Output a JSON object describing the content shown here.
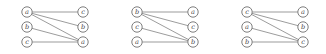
{
  "figure": {
    "type": "bipartite-graph-triptych",
    "background_color": "#ffffff",
    "node_stroke_color": "#6f6f6f",
    "edge_stroke_color": "#8a8a8a",
    "label_color": "#4a4a4a"
  },
  "graphs": [
    {
      "id": "graph-1",
      "left_nodes": [
        {
          "id": "L0",
          "label": "a",
          "cx": 27,
          "cy": 12
        },
        {
          "id": "L1",
          "label": "b",
          "cx": 27,
          "cy": 27
        },
        {
          "id": "L2",
          "label": "c",
          "cx": 27,
          "cy": 42
        }
      ],
      "right_nodes": [
        {
          "id": "R0",
          "label": "c",
          "cx": 83,
          "cy": 12
        },
        {
          "id": "R1",
          "label": "b",
          "cx": 83,
          "cy": 27
        },
        {
          "id": "R2",
          "label": "a",
          "cx": 83,
          "cy": 42
        }
      ],
      "edges": [
        {
          "from": "L0",
          "to": "R0"
        },
        {
          "from": "L0",
          "to": "R1"
        },
        {
          "from": "L0",
          "to": "R2"
        },
        {
          "from": "L1",
          "to": "R2"
        },
        {
          "from": "L2",
          "to": "R2"
        }
      ]
    },
    {
      "id": "graph-2",
      "left_nodes": [
        {
          "id": "L0",
          "label": "b",
          "cx": 27,
          "cy": 12
        },
        {
          "id": "L1",
          "label": "c",
          "cx": 27,
          "cy": 27
        },
        {
          "id": "L2",
          "label": "a",
          "cx": 27,
          "cy": 42
        }
      ],
      "right_nodes": [
        {
          "id": "R0",
          "label": "a",
          "cx": 83,
          "cy": 12
        },
        {
          "id": "R1",
          "label": "c",
          "cx": 83,
          "cy": 27
        },
        {
          "id": "R2",
          "label": "b",
          "cx": 83,
          "cy": 42
        }
      ],
      "edges": [
        {
          "from": "L0",
          "to": "R0"
        },
        {
          "from": "L0",
          "to": "R1"
        },
        {
          "from": "L0",
          "to": "R2"
        },
        {
          "from": "L1",
          "to": "R2"
        },
        {
          "from": "L2",
          "to": "R2"
        }
      ]
    },
    {
      "id": "graph-3",
      "left_nodes": [
        {
          "id": "L0",
          "label": "c",
          "cx": 27,
          "cy": 12
        },
        {
          "id": "L1",
          "label": "a",
          "cx": 27,
          "cy": 27
        },
        {
          "id": "L2",
          "label": "b",
          "cx": 27,
          "cy": 42
        }
      ],
      "right_nodes": [
        {
          "id": "R0",
          "label": "a",
          "cx": 83,
          "cy": 12
        },
        {
          "id": "R1",
          "label": "b",
          "cx": 83,
          "cy": 27
        },
        {
          "id": "R2",
          "label": "c",
          "cx": 83,
          "cy": 42
        }
      ],
      "edges": [
        {
          "from": "L0",
          "to": "R0"
        },
        {
          "from": "L0",
          "to": "R1"
        },
        {
          "from": "L0",
          "to": "R2"
        },
        {
          "from": "L1",
          "to": "R2"
        },
        {
          "from": "L2",
          "to": "R2"
        }
      ]
    }
  ],
  "node_radius": 5.2
}
